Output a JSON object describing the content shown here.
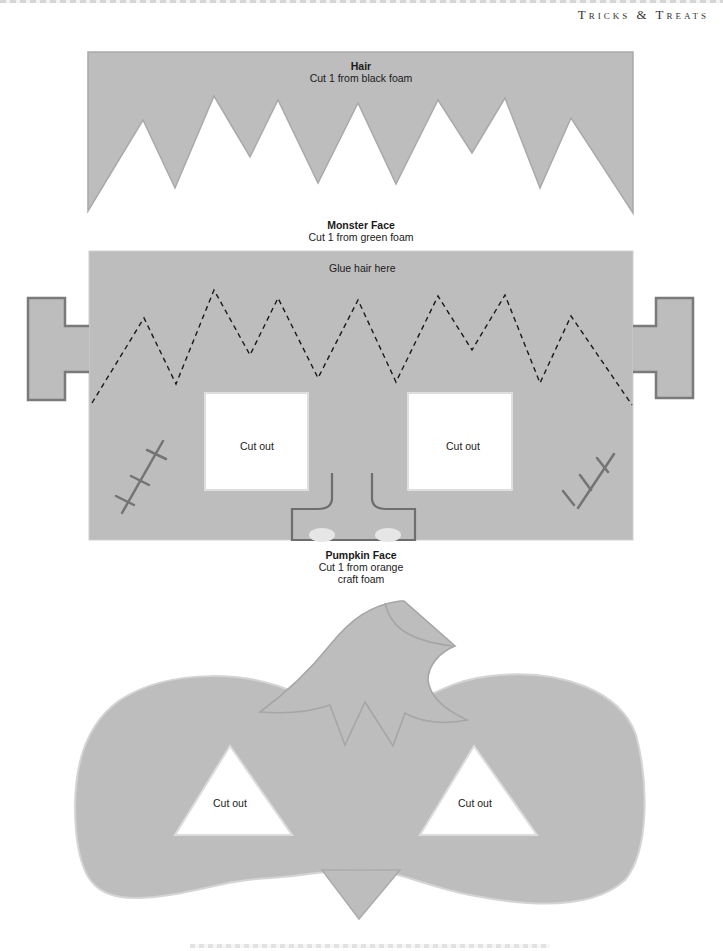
{
  "header": {
    "title": "Tricks & Treats"
  },
  "colors": {
    "template_fill": "#bdbdbd",
    "outline": "#7a7a7a",
    "dash": "#1a1a1a",
    "cutout": "#ffffff"
  },
  "hair": {
    "title": "Hair",
    "instruction": "Cut 1 from black foam"
  },
  "monster_face": {
    "title": "Monster Face",
    "instruction": "Cut 1 from green foam",
    "glue_note": "Glue hair here",
    "left_eye_label": "Cut out",
    "right_eye_label": "Cut out"
  },
  "pumpkin_face": {
    "title": "Pumpkin Face",
    "instruction_line1": "Cut 1 from orange",
    "instruction_line2": "craft foam",
    "left_eye_label": "Cut out",
    "right_eye_label": "Cut out"
  }
}
